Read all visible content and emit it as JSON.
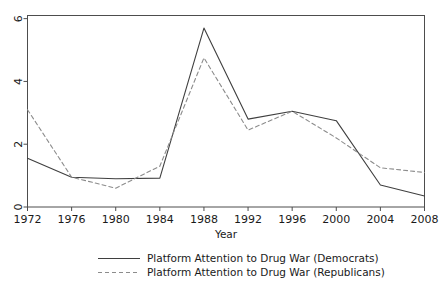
{
  "chart_data": {
    "type": "line",
    "title": "",
    "xlabel": "Year",
    "ylabel": "",
    "x": [
      1972,
      1976,
      1980,
      1984,
      1988,
      1992,
      1996,
      2000,
      2004,
      2008
    ],
    "categories": [
      "1972",
      "1976",
      "1980",
      "1984",
      "1988",
      "1992",
      "1996",
      "2000",
      "2004",
      "2008"
    ],
    "xlim": [
      1972,
      2008
    ],
    "ylim": [
      0,
      6.1
    ],
    "yticks": [
      0,
      2,
      4,
      6
    ],
    "ytick_labels": [
      "0",
      "2",
      "4",
      "6"
    ],
    "xticks": [
      1972,
      1976,
      1980,
      1984,
      1988,
      1992,
      1996,
      2000,
      2004,
      2008
    ],
    "xtick_labels": [
      "1972",
      "1976",
      "1980",
      "1984",
      "1988",
      "1992",
      "1996",
      "2000",
      "2004",
      "2008"
    ],
    "grid": false,
    "legend_position": "bottom",
    "series": [
      {
        "name": "Platform Attention to Drug War (Democrats)",
        "style": "solid",
        "color": "#3f3f3f",
        "dash": "none",
        "values": [
          1.55,
          0.95,
          0.9,
          0.92,
          5.7,
          2.8,
          3.05,
          2.75,
          0.7,
          0.35
        ]
      },
      {
        "name": "Platform Attention to Drug War (Republicans)",
        "style": "dashed",
        "color": "#8c8c8c",
        "dash": "4,3",
        "values": [
          3.1,
          0.95,
          0.6,
          1.3,
          4.75,
          2.45,
          3.05,
          2.2,
          1.25,
          1.1
        ]
      }
    ]
  },
  "axes": {
    "x_axis_title": "Year",
    "y_axis_title": ""
  },
  "legend": {
    "entries": [
      {
        "label": "Platform Attention to Drug War (Democrats)",
        "style": "solid"
      },
      {
        "label": "Platform Attention to Drug War (Republicans)",
        "style": "dashed"
      }
    ]
  },
  "colors": {
    "democrats_line": "#3f3f3f",
    "republicans_line": "#8c8c8c",
    "frame": "#4d4d4d",
    "background": "#ffffff",
    "text": "#1a1a1a"
  }
}
